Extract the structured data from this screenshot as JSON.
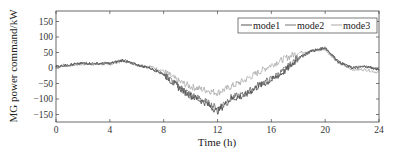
{
  "chart_data": {
    "type": "line",
    "title": "",
    "xlabel": "Time (h)",
    "ylabel": "MG power command/kW",
    "xlim": [
      0,
      24
    ],
    "ylim": [
      -170,
      180
    ],
    "xticks": [
      0,
      4,
      8,
      12,
      16,
      20,
      24
    ],
    "yticks": [
      -150,
      -100,
      -50,
      0,
      50,
      100,
      150
    ],
    "grid": false,
    "legend_position": "upper right",
    "x": [
      0,
      1,
      2,
      3,
      4,
      5,
      6,
      7,
      8,
      9,
      10,
      11,
      12,
      13,
      14,
      15,
      16,
      17,
      18,
      19,
      20,
      21,
      22,
      23,
      24
    ],
    "series": [
      {
        "name": "mode1",
        "color": "#555555",
        "values": [
          5,
          10,
          15,
          15,
          15,
          25,
          10,
          0,
          -20,
          -60,
          -90,
          -110,
          -140,
          -100,
          -90,
          -60,
          -40,
          -10,
          30,
          55,
          65,
          20,
          0,
          5,
          -5
        ]
      },
      {
        "name": "mode2",
        "color": "#777777",
        "values": [
          5,
          10,
          15,
          15,
          15,
          25,
          10,
          0,
          -20,
          -55,
          -85,
          -105,
          -130,
          -95,
          -85,
          -55,
          -35,
          -5,
          35,
          55,
          65,
          20,
          0,
          5,
          -5
        ]
      },
      {
        "name": "mode3",
        "color": "#aaaaaa",
        "values": [
          5,
          8,
          12,
          12,
          12,
          22,
          12,
          5,
          -10,
          -40,
          -60,
          -70,
          -80,
          -60,
          -40,
          -15,
          10,
          30,
          50,
          55,
          60,
          15,
          -5,
          -5,
          -15
        ]
      }
    ]
  }
}
